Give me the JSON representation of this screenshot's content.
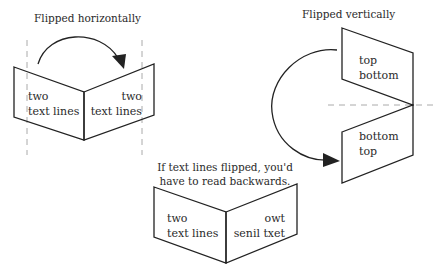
{
  "horizontal": {
    "caption": "Flipped horizontally",
    "left_page": [
      "two",
      "text lines"
    ],
    "right_page": [
      "two",
      "text lines"
    ]
  },
  "vertical": {
    "caption": "Flipped vertically",
    "top_page": [
      "top",
      "bottom"
    ],
    "bottom_page": [
      "bottom",
      "top"
    ]
  },
  "backwards": {
    "caption_line1": "If text lines flipped, you'd",
    "caption_line2": "have to read backwards.",
    "left_page": [
      "two",
      "text lines"
    ],
    "right_page": [
      "owt",
      "senil txet"
    ]
  },
  "colors": {
    "line": "#222222",
    "dash": "#aaaaaa"
  }
}
